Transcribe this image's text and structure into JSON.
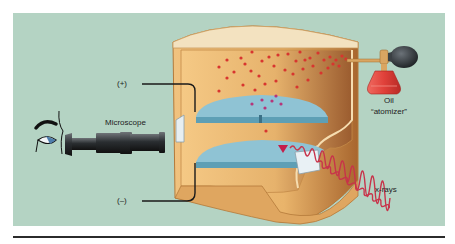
{
  "figure": {
    "labels": {
      "positive": "(+)",
      "negative": "(–)",
      "microscope": "Microscope",
      "oil": "Oil",
      "atomizer": "“atomizer”",
      "xrays": "x-rays"
    },
    "colors": {
      "background": "#b4d3c3",
      "chamber": "#e8b872",
      "chamber_lid": "#f3e2c0",
      "plate": "#8fc3d4",
      "plate_edge": "#5e9fb5",
      "droplet": "#d8352f",
      "charged_droplet": "#b6357a",
      "atomizer_bottle": "#e0413a",
      "bulb": "#2a2f33",
      "xray_wave": "#c8334a",
      "wire": "#1a1a1a"
    }
  }
}
